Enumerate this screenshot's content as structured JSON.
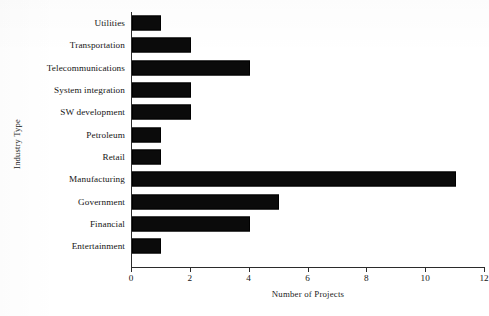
{
  "chart_data": {
    "type": "bar",
    "orientation": "horizontal",
    "title": "",
    "xlabel": "Number of Projects",
    "ylabel": "Industry Type",
    "categories": [
      "Utilities",
      "Transportation",
      "Telecommunications",
      "System integration",
      "SW development",
      "Petroleum",
      "Retail",
      "Manufacturing",
      "Government",
      "Financial",
      "Entertainment"
    ],
    "values": [
      1,
      2,
      4,
      2,
      2,
      1,
      1,
      11,
      5,
      4,
      1
    ],
    "xlim": [
      0,
      12
    ],
    "xticks": [
      0,
      2,
      4,
      6,
      8,
      10,
      12
    ],
    "xtick_labels": [
      "0",
      "2",
      "4",
      "6",
      "8",
      "10",
      "12"
    ],
    "grid": false,
    "legend": false,
    "bar_color": "#0b0b0b",
    "axis_color": "#2b2b2b",
    "background_color": "#ffffff"
  }
}
